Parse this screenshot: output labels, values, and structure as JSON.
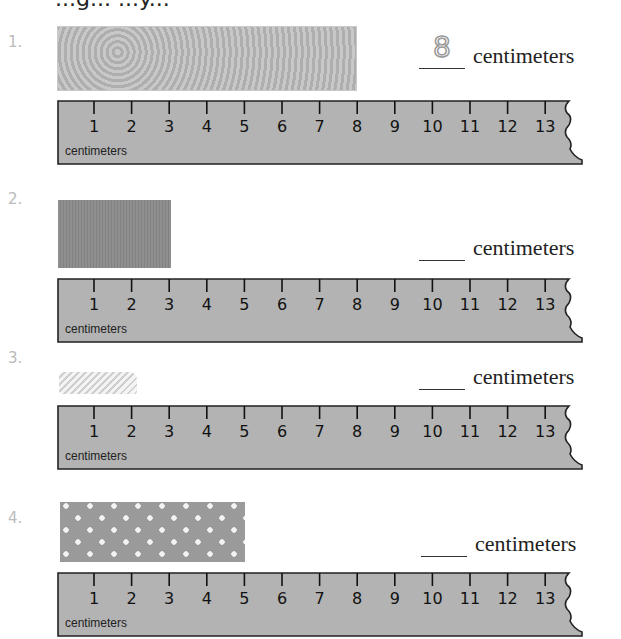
{
  "heading": "...g... ...y...",
  "unit_label": "centimeters",
  "ruler": {
    "unit": "centimeters",
    "ticks": [
      "1",
      "2",
      "3",
      "4",
      "5",
      "6",
      "7",
      "8",
      "9",
      "10",
      "11",
      "12",
      "13"
    ],
    "fill": "#b3b3b3"
  },
  "problems": [
    {
      "number": "1.",
      "ribbon": "lace-ribbon",
      "answer": "8",
      "answer_suffix": "centimeters"
    },
    {
      "number": "2.",
      "ribbon": "grosgrain-ribbon",
      "answer": "",
      "answer_suffix": "centimeters"
    },
    {
      "number": "3.",
      "ribbon": "braided-cord",
      "answer": "",
      "answer_suffix": "centimeters"
    },
    {
      "number": "4.",
      "ribbon": "polka-dot-ribbon",
      "answer": "",
      "answer_suffix": "centimeters"
    }
  ]
}
